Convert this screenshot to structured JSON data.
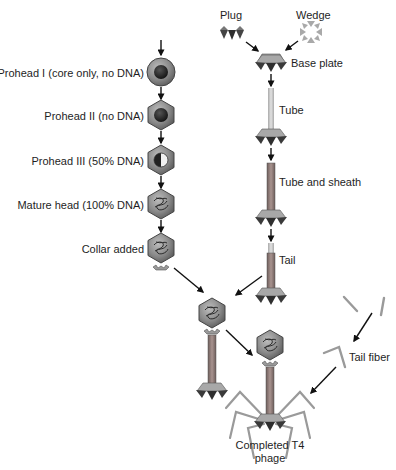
{
  "diagram": {
    "head_pathway": {
      "stages": [
        {
          "label": "Prohead I (core only, no DNA)",
          "icon": "prohead-round-core"
        },
        {
          "label": "Prohead II (no DNA)",
          "icon": "prohead-hex-core"
        },
        {
          "label": "Prohead III (50% DNA)",
          "icon": "prohead-hex-half-dna"
        },
        {
          "label": "Mature head (100% DNA)",
          "icon": "head-hex-dna"
        },
        {
          "label": "Collar added",
          "icon": "head-hex-dna-collar"
        }
      ]
    },
    "tail_pathway": {
      "components": [
        {
          "label": "Plug",
          "icon": "plug-triangles"
        },
        {
          "label": "Wedge",
          "icon": "wedge-triangles"
        }
      ],
      "stages": [
        {
          "label": "Base plate",
          "icon": "base-plate"
        },
        {
          "label": "Tube",
          "icon": "tube-on-base-plate"
        },
        {
          "label": "Tube and sheath",
          "icon": "sheath-on-base-plate"
        },
        {
          "label": "Tail",
          "icon": "tail"
        }
      ]
    },
    "fibers": {
      "label": "Tail fiber",
      "icon": "tail-fiber"
    },
    "final": {
      "label_line1": "Completed T4",
      "label_line2": "phage",
      "icon": "t4-phage"
    },
    "colors": {
      "head_fill": "#8a8a8a",
      "head_core": "#2a2a2a",
      "sheath": "#8c7b78",
      "tube": "#c8c8c8",
      "base_dark": "#3a3a3a",
      "base_light": "#a8a8a8",
      "fiber": "#9a9a9a",
      "arrow": "#111111"
    }
  }
}
